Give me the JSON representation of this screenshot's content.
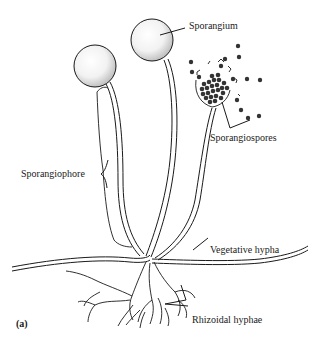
{
  "diagram": {
    "panel_label": "(a)",
    "labels": {
      "sporangium": "Sporangium",
      "sporangiospores": "Sporangiospores",
      "sporangiophore": "Sporangiophore",
      "vegetative_hypha": "Vegetative hypha",
      "rhizoidal_hyphae": "Rhizoidal hyphae"
    },
    "colors": {
      "line": "#1a1a1a",
      "spore": "#333333",
      "background": "#ffffff"
    }
  }
}
